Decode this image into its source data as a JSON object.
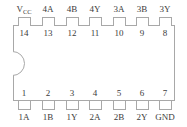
{
  "diagram": {
    "type": "dip-14-ic-pinout",
    "package": "DIP-14",
    "pin_count": 14,
    "colors": {
      "outline": "#a8a8a8",
      "text": "#3b3b3b",
      "background": "#ffffff"
    },
    "notch": {
      "name": "orientation-notch",
      "side": "left",
      "shape": "semicircle"
    },
    "top_row": [
      {
        "number": "14",
        "label": "V",
        "label_sub": "CC",
        "label_full": "VCC",
        "x": 24
      },
      {
        "number": "13",
        "label": "4A",
        "label_sub": "",
        "label_full": "4A",
        "x": 48
      },
      {
        "number": "12",
        "label": "4B",
        "label_sub": "",
        "label_full": "4B",
        "x": 72
      },
      {
        "number": "11",
        "label": "4Y",
        "label_sub": "",
        "label_full": "4Y",
        "x": 95
      },
      {
        "number": "10",
        "label": "3A",
        "label_sub": "",
        "label_full": "3A",
        "x": 119
      },
      {
        "number": "9",
        "label": "3B",
        "label_sub": "",
        "label_full": "3B",
        "x": 142
      },
      {
        "number": "8",
        "label": "3Y",
        "label_sub": "",
        "label_full": "3Y",
        "x": 165
      }
    ],
    "bottom_row": [
      {
        "number": "1",
        "label": "1A",
        "label_sub": "",
        "label_full": "1A",
        "x": 24
      },
      {
        "number": "2",
        "label": "1B",
        "label_sub": "",
        "label_full": "1B",
        "x": 48
      },
      {
        "number": "3",
        "label": "1Y",
        "label_sub": "",
        "label_full": "1Y",
        "x": 72
      },
      {
        "number": "4",
        "label": "2A",
        "label_sub": "",
        "label_full": "2A",
        "x": 95
      },
      {
        "number": "5",
        "label": "2B",
        "label_sub": "",
        "label_full": "2B",
        "x": 119
      },
      {
        "number": "6",
        "label": "2Y",
        "label_sub": "",
        "label_full": "2Y",
        "x": 142
      },
      {
        "number": "7",
        "label": "GND",
        "label_sub": "",
        "label_full": "GND",
        "x": 165
      }
    ]
  }
}
